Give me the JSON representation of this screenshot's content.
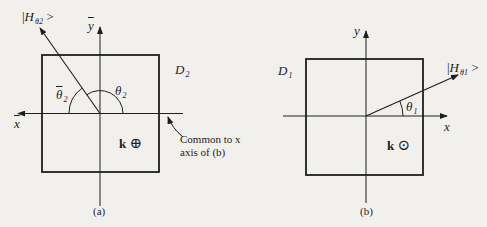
{
  "figure_a": {
    "caption": "(a)",
    "domain_label": {
      "main": "D",
      "sub": "2"
    },
    "vector_label": {
      "prefix": "|",
      "main": "H",
      "sub": "θ2",
      "suffix": " >"
    },
    "x_axis_label": "x",
    "y_axis_label": "y",
    "angle_label": {
      "main": "θ",
      "sub": "2"
    },
    "angle_bar_label": {
      "main": "θ",
      "sub": "2"
    },
    "k_label": "k",
    "k_symbol": "⊕",
    "note_line1": "Common to x",
    "note_line2": "axis of (b)"
  },
  "figure_b": {
    "caption": "(b)",
    "domain_label": {
      "main": "D",
      "sub": "1"
    },
    "vector_label": {
      "prefix": "|",
      "main": "H",
      "sub": "θ1",
      "suffix": " >"
    },
    "x_axis_label": "x",
    "y_axis_label": "y",
    "angle_label": {
      "main": "θ",
      "sub": "1"
    },
    "k_label": "k",
    "k_symbol": "⊙"
  },
  "colors": {
    "background": "#f1f0ed",
    "ink": "#1e1e1e"
  }
}
